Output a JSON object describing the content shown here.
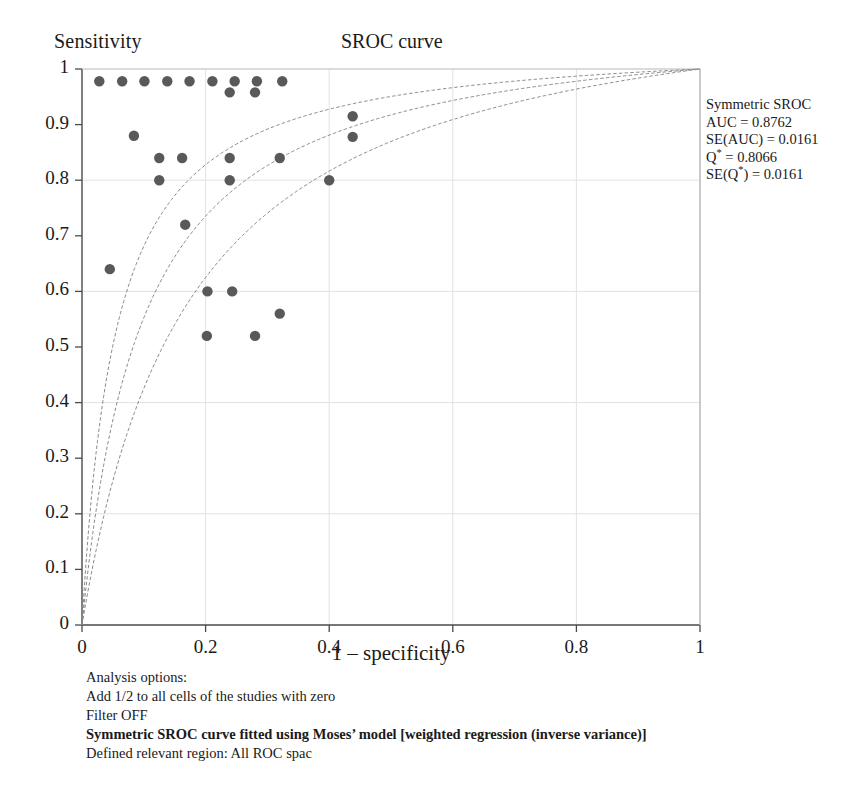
{
  "chart_data": {
    "type": "scatter",
    "title": "SROC curve",
    "xlabel": "1 – specificity",
    "ylabel": "Sensitivity",
    "xlim": [
      0,
      1
    ],
    "ylim": [
      0,
      1
    ],
    "grid": true,
    "xticks": [
      "0",
      "0.2",
      "0.4",
      "0.6",
      "0.8",
      "1"
    ],
    "xtick_values": [
      0,
      0.2,
      0.4,
      0.6,
      0.8,
      1
    ],
    "yticks": [
      "0",
      "0.1",
      "0.2",
      "0.3",
      "0.4",
      "0.5",
      "0.6",
      "0.7",
      "0.8",
      "0.9",
      "1"
    ],
    "ytick_values": [
      0,
      0.1,
      0.2,
      0.3,
      0.4,
      0.5,
      0.6,
      0.7,
      0.8,
      0.9,
      1
    ],
    "series": [
      {
        "name": "Study estimates",
        "marker": "filled-circle",
        "color": "#595959",
        "points": [
          {
            "x": 0.028,
            "y": 0.978
          },
          {
            "x": 0.065,
            "y": 0.978
          },
          {
            "x": 0.101,
            "y": 0.978
          },
          {
            "x": 0.138,
            "y": 0.978
          },
          {
            "x": 0.174,
            "y": 0.978
          },
          {
            "x": 0.211,
            "y": 0.978
          },
          {
            "x": 0.247,
            "y": 0.978
          },
          {
            "x": 0.283,
            "y": 0.978
          },
          {
            "x": 0.324,
            "y": 0.978
          },
          {
            "x": 0.239,
            "y": 0.958
          },
          {
            "x": 0.28,
            "y": 0.958
          },
          {
            "x": 0.084,
            "y": 0.88
          },
          {
            "x": 0.125,
            "y": 0.84
          },
          {
            "x": 0.162,
            "y": 0.84
          },
          {
            "x": 0.125,
            "y": 0.8
          },
          {
            "x": 0.239,
            "y": 0.84
          },
          {
            "x": 0.239,
            "y": 0.8
          },
          {
            "x": 0.32,
            "y": 0.84
          },
          {
            "x": 0.438,
            "y": 0.915
          },
          {
            "x": 0.438,
            "y": 0.878
          },
          {
            "x": 0.4,
            "y": 0.8
          },
          {
            "x": 0.167,
            "y": 0.72
          },
          {
            "x": 0.045,
            "y": 0.64
          },
          {
            "x": 0.203,
            "y": 0.6
          },
          {
            "x": 0.243,
            "y": 0.6
          },
          {
            "x": 0.32,
            "y": 0.56
          },
          {
            "x": 0.202,
            "y": 0.52
          },
          {
            "x": 0.28,
            "y": 0.52
          }
        ]
      }
    ],
    "curves": [
      {
        "name": "upper-confidence-curve",
        "color": "#8a8a8a",
        "shape_param": 0.052,
        "description": "Upper symmetric SROC confidence bound"
      },
      {
        "name": "fitted-sroc-curve",
        "color": "#8a8a8a",
        "shape_param": 0.09,
        "description": "Fitted symmetric SROC curve (Moses' model)"
      },
      {
        "name": "lower-confidence-curve",
        "color": "#8a8a8a",
        "shape_param": 0.15,
        "description": "Lower symmetric SROC confidence bound"
      }
    ]
  },
  "legend": {
    "title": "Symmetric SROC",
    "lines": [
      "Symmetric SROC",
      "AUC = 0.8762",
      "SE(AUC) = 0.0161",
      "Q* = 0.8066",
      "SE(Q*) = 0.0161"
    ],
    "auc_label": "AUC = 0.8762",
    "se_auc_label": "SE(AUC) = 0.0161",
    "qstar_label": "Q* = 0.8066",
    "se_qstar_label": "SE(Q*) = 0.0161"
  },
  "footer": {
    "lines": [
      "Analysis options:",
      "Add 1/2 to all cells of the studies with zero",
      "Filter OFF",
      "Symmetric SROC curve fitted using Moses’ model [weighted regression (inverse variance)]",
      "Defined relevant region: All ROC spac"
    ],
    "line1": "Analysis options:",
    "line2": "Add 1/2 to all cells of the studies with zero",
    "line3": "Filter OFF",
    "line4": "Symmetric SROC curve fitted using Moses’ model [weighted regression (inverse variance)]",
    "line5": "Defined relevant region: All ROC spac"
  },
  "colors": {
    "marker": "#595959",
    "curve": "#8a8a8a",
    "axis": "#4a4a4a",
    "grid": "#e2e2e2",
    "text": "#1a1a1a"
  },
  "geometry": {
    "x0": 82,
    "x1": 700,
    "y0": 625,
    "y1": 69
  }
}
